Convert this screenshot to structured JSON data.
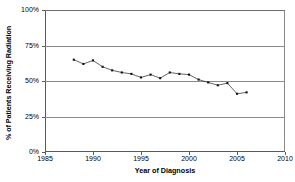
{
  "chart_data": {
    "type": "line",
    "title": "",
    "xlabel": "Year of Diagnosis",
    "ylabel": "% of Patients Receiving Radiation",
    "xlim": [
      1985,
      2010
    ],
    "ylim": [
      0,
      100
    ],
    "grid": "horizontal",
    "legend": "none",
    "marker": "square",
    "marker_color": "#111111",
    "line_color": "#222222",
    "x_ticks": [
      "1985",
      "1990",
      "1995",
      "2000",
      "2005",
      "2010"
    ],
    "x_tick_values": [
      1985,
      1990,
      1995,
      2000,
      2005,
      2010
    ],
    "y_ticks": [
      "0%",
      "25%",
      "50%",
      "75%",
      "100%"
    ],
    "y_tick_values": [
      0,
      25,
      50,
      75,
      100
    ],
    "x": [
      1988,
      1989,
      1990,
      1991,
      1992,
      1993,
      1994,
      1995,
      1996,
      1997,
      1998,
      1999,
      2000,
      2001,
      2002,
      2003,
      2004,
      2005,
      2006
    ],
    "values": [
      65,
      62,
      64.5,
      60,
      57.5,
      56,
      55,
      52.5,
      54.5,
      52,
      56,
      55,
      54.5,
      51,
      49,
      47,
      48.5,
      41,
      42
    ],
    "series": [
      {
        "name": "% of Patients Receiving Radiation",
        "values": [
          65,
          62,
          64.5,
          60,
          57.5,
          56,
          55,
          52.5,
          54.5,
          52,
          56,
          55,
          54.5,
          51,
          49,
          47,
          48.5,
          41,
          42
        ]
      }
    ]
  }
}
